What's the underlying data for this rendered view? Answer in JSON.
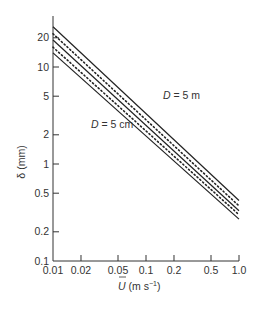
{
  "chart_data": {
    "type": "line",
    "title": "",
    "xlabel": "Ū (m s⁻¹)",
    "ylabel": "δ (mm)",
    "xscale": "log",
    "yscale": "log",
    "xlim": [
      0.01,
      1.0
    ],
    "ylim": [
      0.1,
      30
    ],
    "x_ticks": [
      "0.01",
      "0.02",
      "0.05",
      "0.1",
      "0.2",
      "0.5",
      "1.0"
    ],
    "y_ticks": [
      "0.1",
      "0.2",
      "0.5",
      "1",
      "2",
      "5",
      "10",
      "20"
    ],
    "grid": false,
    "legend": null,
    "annotations": [
      {
        "text": "D = 5 m",
        "near_series": "upper"
      },
      {
        "text": "D = 5 cm",
        "near_series": "lower"
      }
    ],
    "x": [
      0.01,
      1.0
    ],
    "series": [
      {
        "name": "D = 5 m (upper bound)",
        "style": "solid",
        "values": [
          26,
          0.42
        ]
      },
      {
        "name": "D = 5 m",
        "style": "dotted",
        "values": [
          22,
          0.37
        ]
      },
      {
        "name": "intermediate",
        "style": "solid",
        "values": [
          19,
          0.33
        ]
      },
      {
        "name": "D = 5 cm",
        "style": "dotted",
        "values": [
          16,
          0.3
        ]
      },
      {
        "name": "D = 5 cm (lower bound)",
        "style": "solid",
        "values": [
          14,
          0.27
        ]
      }
    ]
  },
  "labels": {
    "d5m_prefix": "D",
    "d5m_suffix": " = 5 m",
    "d5cm_prefix": "D",
    "d5cm_suffix": " = 5 cm",
    "ylabel": "δ (mm)",
    "xlabel_sym": "U",
    "xlabel_unit": " (m s",
    "xlabel_exp": "−1",
    "xlabel_close": ")"
  }
}
